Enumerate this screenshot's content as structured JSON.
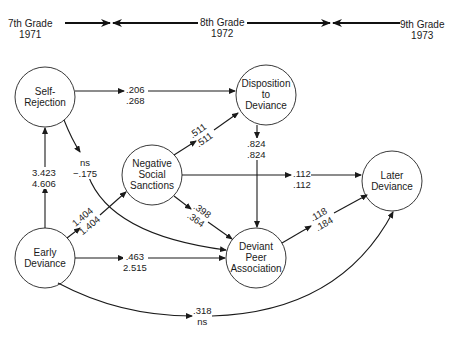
{
  "timeline": {
    "grades": [
      {
        "label": "7th Grade",
        "year": "1971"
      },
      {
        "label": "8th Grade",
        "year": "1972"
      },
      {
        "label": "9th Grade",
        "year": "1973"
      }
    ]
  },
  "nodes": {
    "self_rejection": {
      "line1": "Self-",
      "line2": "Rejection"
    },
    "disposition": {
      "line1": "Disposition",
      "line2": "to",
      "line3": "Deviance"
    },
    "negative_sanctions": {
      "line1": "Negative",
      "line2": "Social",
      "line3": "Sanctions"
    },
    "later_deviance": {
      "line1": "Later",
      "line2": "Deviance"
    },
    "early_deviance": {
      "line1": "Early",
      "line2": "Deviance"
    },
    "deviant_peer": {
      "line1": "Deviant",
      "line2": "Peer",
      "line3": "Association"
    }
  },
  "paths": {
    "sr_to_disp": {
      "top": ".206",
      "bottom": ".268"
    },
    "sr_to_dpa": {
      "top": "ns",
      "bottom": "−.175"
    },
    "ed_to_sr": {
      "top": "3.423",
      "bottom": "4.606"
    },
    "ed_to_nss": {
      "top": "1.404",
      "bottom": "1.404"
    },
    "nss_to_disp": {
      "top": ".511",
      "bottom": ".511"
    },
    "disp_to_dpa": {
      "top": ".824",
      "bottom": ".824"
    },
    "nss_to_ld": {
      "top": ".112",
      "bottom": ".112"
    },
    "nss_to_dpa": {
      "top": ".398",
      "bottom": ".364"
    },
    "ed_to_dpa": {
      "top": ".463",
      "bottom": "2.515"
    },
    "dpa_to_ld": {
      "top": ".118",
      "bottom": ".184"
    },
    "ed_to_ld": {
      "top": ".318",
      "bottom": "ns"
    }
  }
}
